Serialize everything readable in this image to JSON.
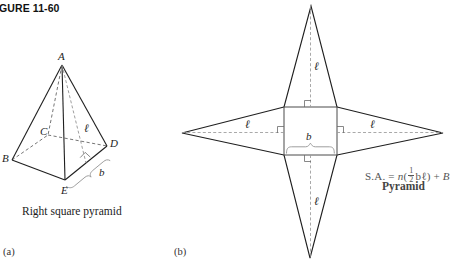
{
  "figure": {
    "title": "IGURE 11-60",
    "parts": [
      {
        "key": "a",
        "label": "(a)"
      },
      {
        "key": "b",
        "label": "(b)"
      }
    ]
  },
  "part_a": {
    "caption": "Right square pyramid",
    "vertices": [
      {
        "name": "A",
        "label": "A",
        "x": 62,
        "y": 65,
        "role": "apex"
      },
      {
        "name": "B",
        "label": "B",
        "x": 12,
        "y": 160,
        "role": "base-front-left"
      },
      {
        "name": "C",
        "label": "C",
        "x": 48,
        "y": 135,
        "role": "base-back-hidden"
      },
      {
        "name": "D",
        "label": "D",
        "x": 107,
        "y": 146,
        "role": "base-right"
      },
      {
        "name": "E",
        "label": "E",
        "x": 65,
        "y": 180,
        "role": "base-front"
      }
    ],
    "measure_labels": [
      {
        "name": "slant-height",
        "text": "ℓ",
        "x": 85,
        "y": 128
      },
      {
        "name": "base-edge",
        "text": "b",
        "x": 100,
        "y": 172
      }
    ]
  },
  "part_b": {
    "net": {
      "square": {
        "left": 284,
        "top": 107,
        "right": 337,
        "bottom": 155
      },
      "apexes": [
        {
          "name": "top-apex",
          "x": 311,
          "y": 6
        },
        {
          "name": "right-apex",
          "x": 443,
          "y": 133
        },
        {
          "name": "bottom-apex",
          "x": 310,
          "y": 258
        },
        {
          "name": "left-apex",
          "x": 182,
          "y": 133
        }
      ]
    },
    "measure_labels": [
      {
        "name": "slant-height-top",
        "text": "ℓ",
        "x": 315,
        "y": 66
      },
      {
        "name": "slant-height-left",
        "text": "ℓ",
        "x": 246,
        "y": 124
      },
      {
        "name": "slant-height-right",
        "text": "ℓ",
        "x": 371,
        "y": 124
      },
      {
        "name": "slant-height-bottom",
        "text": "ℓ",
        "x": 315,
        "y": 201
      },
      {
        "name": "base-edge",
        "text": "b",
        "x": 307,
        "y": 137
      }
    ],
    "formula": {
      "prefix": "S.A. = ",
      "n": "n",
      "open_paren": "(",
      "fraction_numerator": "1",
      "fraction_denominator": "2",
      "product": "bℓ",
      "close_paren": ")",
      "suffix": " + ",
      "base_area": "B",
      "name": "Pyramid"
    }
  },
  "colors": {
    "stroke": "#1f1f1f",
    "hidden_stroke": "#8d8d8d",
    "brace": "#9a9a9a",
    "formula": "#555555",
    "background": "#ffffff"
  }
}
